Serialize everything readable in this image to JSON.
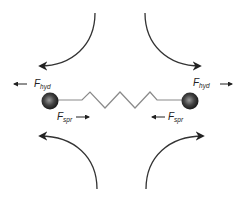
{
  "diagram": {
    "particles": [
      {
        "id": "left-bead",
        "color": "#333333"
      },
      {
        "id": "right-bead",
        "color": "#333333"
      }
    ],
    "connector": {
      "type": "spring",
      "color": "#888888"
    },
    "flow_arrows": [
      {
        "id": "top-left",
        "direction": "down-left"
      },
      {
        "id": "top-right",
        "direction": "down-right"
      },
      {
        "id": "bottom-left",
        "direction": "up-left"
      },
      {
        "id": "bottom-right",
        "direction": "up-right"
      }
    ],
    "labels": {
      "hyd_left": {
        "main": "F",
        "sub": "hyd",
        "arrow": "left"
      },
      "hyd_right": {
        "main": "F",
        "sub": "hyd",
        "arrow": "right"
      },
      "spr_left": {
        "main": "F",
        "sub": "spr",
        "arrow": "right"
      },
      "spr_right": {
        "main": "F",
        "sub": "spr",
        "arrow": "left"
      }
    }
  }
}
